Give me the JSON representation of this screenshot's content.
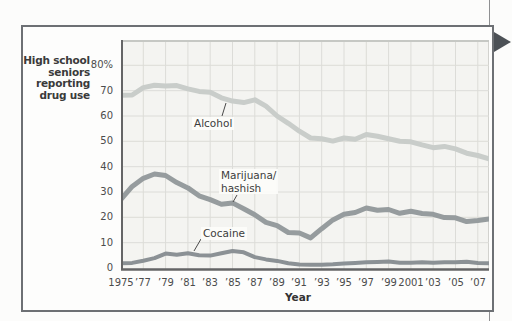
{
  "figure": {
    "y_axis_title_lines": [
      "High school",
      "seniors",
      "reporting",
      "drug use"
    ],
    "x_axis_label": "Year",
    "y_tick_labels": [
      "80%",
      "70",
      "60",
      "50",
      "40",
      "30",
      "20",
      "10",
      "0"
    ],
    "y_tick_values": [
      80,
      70,
      60,
      50,
      40,
      30,
      20,
      10,
      0
    ],
    "x_tick_labels": [
      "1975",
      "’77",
      "’79",
      "’81",
      "’83",
      "’85",
      "’87",
      "’89",
      "’91",
      "’93",
      "’95",
      "’97",
      "’99",
      "2001",
      "’03",
      "’05",
      "’07"
    ],
    "x_tick_years": [
      1975,
      1977,
      1979,
      1981,
      1983,
      1985,
      1987,
      1989,
      1991,
      1993,
      1995,
      1997,
      1999,
      2001,
      2003,
      2005,
      2007
    ],
    "annotations": [
      {
        "name": "alcohol-label",
        "lines": [
          "Alcohol"
        ]
      },
      {
        "name": "marijuana-label",
        "lines": [
          "Marijuana/",
          "hashish"
        ]
      },
      {
        "name": "cocaine-label",
        "lines": [
          "Cocaine"
        ]
      }
    ],
    "colors": {
      "alcohol_line": "#c9cdca",
      "marijuana_line": "#969c9e",
      "cocaine_line": "#8b9195",
      "plot_bg": "#f4f4f1",
      "gridline": "#dcdcd8",
      "plot_top_border": "#c6c8c4",
      "plot_right_border": "#d2d2ce",
      "axis_line": "#646566",
      "callout_line": "#4a4a4a",
      "box_border": "#6d7074",
      "arrow_marker": "#4c5156"
    }
  },
  "chart_data": {
    "type": "line",
    "title": "",
    "xlabel": "Year",
    "ylabel": "High school seniors reporting drug use",
    "ylim": [
      0,
      90
    ],
    "xlim": [
      1975,
      2008
    ],
    "grid": true,
    "legend_position": "inline-annotations",
    "x": [
      1975,
      1976,
      1977,
      1978,
      1979,
      1980,
      1981,
      1982,
      1983,
      1984,
      1985,
      1986,
      1987,
      1988,
      1989,
      1990,
      1991,
      1992,
      1993,
      1994,
      1995,
      1996,
      1997,
      1998,
      1999,
      2000,
      2001,
      2002,
      2003,
      2004,
      2005,
      2006,
      2007,
      2008
    ],
    "series": [
      {
        "name": "Alcohol",
        "values": [
          68.2,
          68.3,
          71.2,
          72.1,
          71.8,
          72.0,
          70.7,
          69.7,
          69.4,
          67.2,
          65.9,
          65.3,
          66.4,
          63.9,
          60.0,
          57.1,
          54.0,
          51.3,
          51.0,
          50.1,
          51.3,
          50.8,
          52.7,
          52.0,
          51.0,
          50.0,
          49.8,
          48.6,
          47.5,
          48.0,
          47.0,
          45.3,
          44.4,
          43.1
        ]
      },
      {
        "name": "Marijuana/hashish",
        "values": [
          27.1,
          32.2,
          35.4,
          37.1,
          36.5,
          33.7,
          31.6,
          28.5,
          27.0,
          25.2,
          25.7,
          23.4,
          21.0,
          18.0,
          16.7,
          14.0,
          13.8,
          11.9,
          15.5,
          19.0,
          21.2,
          21.9,
          23.7,
          22.8,
          23.1,
          21.6,
          22.4,
          21.5,
          21.2,
          19.9,
          19.8,
          18.3,
          18.8,
          19.4
        ]
      },
      {
        "name": "Cocaine",
        "values": [
          1.9,
          2.0,
          2.9,
          3.9,
          5.7,
          5.2,
          5.8,
          5.0,
          4.9,
          5.8,
          6.7,
          6.2,
          4.3,
          3.4,
          2.8,
          1.9,
          1.4,
          1.3,
          1.3,
          1.5,
          1.8,
          2.0,
          2.3,
          2.4,
          2.6,
          2.1,
          2.1,
          2.3,
          2.1,
          2.3,
          2.3,
          2.5,
          2.0,
          1.9
        ]
      }
    ]
  }
}
